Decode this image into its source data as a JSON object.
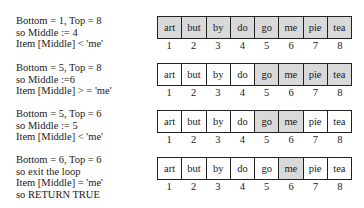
{
  "steps": [
    {
      "lines": [
        "Bottom = 1, Top = 8",
        "so Middle := 4",
        "Item [Middle] < 'me'"
      ],
      "cells": [
        "art",
        "but",
        "by",
        "do",
        "go",
        "me",
        "pie",
        "tea"
      ],
      "shaded": [
        true,
        true,
        true,
        true,
        true,
        true,
        true,
        true
      ],
      "indices": [
        "1",
        "2",
        "3",
        "4",
        "5",
        "6",
        "7",
        "8"
      ]
    },
    {
      "lines": [
        "Bottom = 5, Top = 8",
        "so Middle :=6",
        "Item [Middle] > = 'me'"
      ],
      "cells": [
        "art",
        "but",
        "by",
        "do",
        "go",
        "me",
        "pie",
        "tea"
      ],
      "shaded": [
        false,
        false,
        false,
        false,
        true,
        true,
        true,
        true
      ],
      "indices": [
        "1",
        "2",
        "3",
        "4",
        "5",
        "6",
        "7",
        "8"
      ]
    },
    {
      "lines": [
        "Bottom = 5, Top = 6",
        "so Middle := 5",
        "Item [Middle] < 'me'"
      ],
      "cells": [
        "art",
        "but",
        "by",
        "do",
        "go",
        "me",
        "pie",
        "tea"
      ],
      "shaded": [
        false,
        false,
        false,
        false,
        true,
        true,
        false,
        false
      ],
      "indices": [
        "1",
        "2",
        "3",
        "4",
        "5",
        "6",
        "7",
        "8"
      ]
    },
    {
      "lines": [
        "Bottom = 6, Top = 6",
        "so exit the loop",
        "Item [Middle] = 'me'",
        "so RETURN TRUE"
      ],
      "cells": [
        "art",
        "but",
        "by",
        "do",
        "go",
        "me",
        "pie",
        "tea"
      ],
      "shaded": [
        false,
        false,
        false,
        false,
        false,
        true,
        false,
        false
      ],
      "indices": [
        "1",
        "2",
        "3",
        "4",
        "5",
        "6",
        "7",
        "8"
      ]
    }
  ]
}
